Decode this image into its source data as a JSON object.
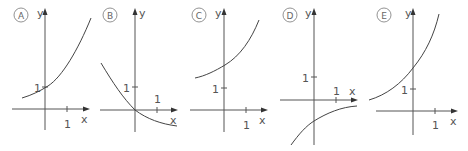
{
  "graphs": [
    {
      "label": "A",
      "y_label": "y",
      "x_label": "x",
      "tick_y": "1",
      "tick_x": "1"
    },
    {
      "label": "B",
      "y_label": "y",
      "x_label": "x",
      "tick_y": "1",
      "tick_x": "1"
    },
    {
      "label": "C",
      "y_label": "y",
      "x_label": "x",
      "tick_y": "1",
      "tick_x": "1"
    },
    {
      "label": "D",
      "y_label": "y",
      "x_label": "x",
      "tick_y": "1",
      "tick_x": "1"
    },
    {
      "label": "E",
      "y_label": "y",
      "x_label": "x",
      "tick_y": "1",
      "tick_x": "1"
    }
  ],
  "colors": {
    "axis": "#555555",
    "curve": "#444444"
  }
}
